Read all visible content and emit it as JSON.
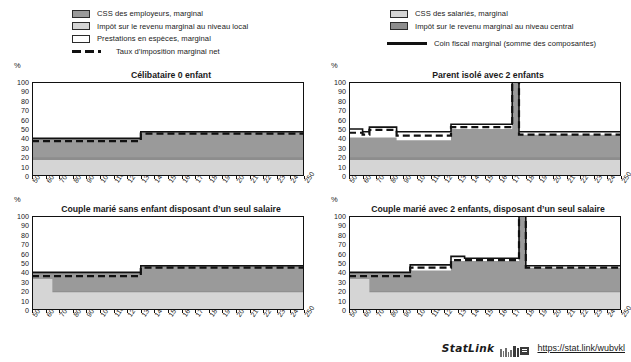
{
  "legend": {
    "left_items": [
      {
        "key": "css-employeurs",
        "swatch": "dark",
        "label": "CSS des employeurs, marginal"
      },
      {
        "key": "impot-local",
        "swatch": "light",
        "label": "Impôt sur le revenu marginal au niveau local"
      },
      {
        "key": "prestations",
        "swatch": "white",
        "label": "Prestations en espèces, marginal"
      },
      {
        "key": "taux-net",
        "swatch": "dashed",
        "label": "Taux d’imposition marginal net"
      }
    ],
    "right_items": [
      {
        "key": "css-salaries",
        "swatch": "light",
        "label": "CSS des salariés, marginal"
      },
      {
        "key": "impot-central",
        "swatch": "mid",
        "label": "Impôt sur le revenu marginal au niveau central"
      },
      {
        "key": "coin-fiscal",
        "swatch": "solid",
        "label": "Coin fiscal marginal (somme des composantes)"
      }
    ]
  },
  "axis": {
    "unit": "%",
    "y_ticks": [
      100,
      90,
      80,
      70,
      60,
      50,
      40,
      30,
      20,
      10,
      0
    ],
    "x_ticks": [
      50,
      60,
      70,
      80,
      90,
      100,
      110,
      120,
      130,
      140,
      150,
      160,
      170,
      180,
      190,
      200,
      210,
      220,
      230,
      240,
      250
    ]
  },
  "footer": {
    "statlink_word": "StatLink",
    "statlink_glyph": "barcode-icon",
    "url": "https://stat.link/wubvkl"
  },
  "colors": {
    "css_employeurs": "#9a9a9a",
    "impot_central": "#8d8d8d",
    "css_salaries": "#d5d5d5",
    "impot_local": "#d5d5d5",
    "prestations": "#ffffff",
    "line": "#111111"
  },
  "chart_data": [
    {
      "id": "celibataire-0-enfant",
      "type": "area",
      "title": "Célibataire 0 enfant",
      "xlabel": "",
      "ylabel": "%",
      "xlim": [
        50,
        250
      ],
      "ylim": [
        0,
        100
      ],
      "grid": false,
      "legend_position": "top",
      "x": [
        50,
        60,
        70,
        80,
        90,
        100,
        110,
        120,
        125,
        130,
        140,
        150,
        160,
        170,
        180,
        190,
        200,
        210,
        220,
        230,
        240,
        250
      ],
      "series": [
        {
          "name": "CSS des salariés, marginal",
          "stack": 1,
          "values": [
            5,
            5,
            5,
            5,
            5,
            5,
            5,
            5,
            5,
            5,
            5,
            5,
            5,
            5,
            5,
            5,
            5,
            5,
            5,
            5,
            5,
            5
          ]
        },
        {
          "name": "Impôt sur le revenu marginal au niveau local",
          "stack": 2,
          "values": [
            17,
            17,
            17,
            17,
            17,
            17,
            17,
            17,
            17,
            17,
            17,
            17,
            17,
            17,
            17,
            17,
            17,
            17,
            17,
            17,
            17,
            17
          ]
        },
        {
          "name": "Impôt sur le revenu marginal au niveau central",
          "stack": 3,
          "values": [
            20,
            20,
            20,
            20,
            20,
            20,
            20,
            20,
            20,
            20,
            20,
            20,
            20,
            20,
            20,
            20,
            20,
            20,
            20,
            20,
            20,
            20
          ]
        },
        {
          "name": "CSS des employeurs, marginal",
          "stack": 4,
          "values": [
            40,
            40,
            40,
            40,
            40,
            40,
            40,
            40,
            40,
            47,
            47,
            47,
            47,
            47,
            47,
            47,
            47,
            47,
            47,
            47,
            47,
            47
          ]
        }
      ],
      "lines": [
        {
          "name": "Coin fiscal marginal (somme des composantes)",
          "style": "solid",
          "values": [
            40,
            40,
            40,
            40,
            40,
            40,
            40,
            40,
            40,
            47,
            47,
            47,
            47,
            47,
            47,
            47,
            47,
            47,
            47,
            47,
            47,
            47
          ]
        },
        {
          "name": "Taux d’imposition marginal net",
          "style": "dashed",
          "values": [
            37,
            37,
            37,
            37,
            37,
            37,
            37,
            37,
            37,
            45,
            45,
            45,
            45,
            45,
            45,
            45,
            45,
            45,
            45,
            45,
            45,
            45
          ]
        }
      ]
    },
    {
      "id": "parent-isole-2-enfants",
      "type": "area",
      "title": "Parent isolé avec 2 enfants",
      "xlabel": "",
      "ylabel": "%",
      "xlim": [
        50,
        250
      ],
      "ylim": [
        0,
        100
      ],
      "grid": false,
      "legend_position": "top",
      "x": [
        50,
        60,
        65,
        70,
        80,
        85,
        90,
        100,
        110,
        120,
        125,
        130,
        140,
        150,
        160,
        168,
        170,
        172,
        175,
        180,
        190,
        200,
        210,
        220,
        230,
        240,
        250
      ],
      "series": [
        {
          "name": "CSS des salariés, marginal",
          "stack": 1,
          "values": [
            5,
            5,
            5,
            5,
            5,
            5,
            5,
            5,
            5,
            5,
            5,
            5,
            5,
            5,
            5,
            5,
            5,
            5,
            5,
            5,
            5,
            5,
            5,
            5,
            5,
            5,
            5
          ]
        },
        {
          "name": "Impôt sur le revenu marginal au niveau local",
          "stack": 2,
          "values": [
            17,
            17,
            17,
            17,
            17,
            17,
            17,
            17,
            17,
            17,
            17,
            17,
            17,
            17,
            17,
            17,
            17,
            17,
            17,
            17,
            17,
            17,
            17,
            17,
            17,
            17,
            17
          ]
        },
        {
          "name": "Impôt sur le revenu marginal au niveau central",
          "stack": 3,
          "values": [
            20,
            20,
            20,
            20,
            20,
            20,
            20,
            20,
            20,
            20,
            20,
            20,
            20,
            20,
            20,
            20,
            20,
            20,
            20,
            20,
            20,
            20,
            20,
            20,
            20,
            20,
            20
          ]
        },
        {
          "name": "CSS des employeurs, marginal",
          "stack": 4,
          "values": [
            41,
            41,
            41,
            41,
            41,
            38,
            38,
            38,
            38,
            38,
            50,
            50,
            50,
            50,
            50,
            50,
            100,
            100,
            44,
            44,
            44,
            44,
            44,
            44,
            44,
            44,
            44
          ]
        }
      ],
      "lines": [
        {
          "name": "Coin fiscal marginal (somme des composantes)",
          "style": "solid",
          "values": [
            50,
            47,
            52,
            52,
            52,
            47,
            47,
            47,
            47,
            47,
            55,
            55,
            55,
            55,
            55,
            55,
            100,
            100,
            47,
            47,
            47,
            47,
            47,
            47,
            47,
            47,
            47
          ]
        },
        {
          "name": "Taux d’imposition marginal net",
          "style": "dashed",
          "values": [
            46,
            44,
            49,
            49,
            49,
            43,
            43,
            43,
            43,
            43,
            52,
            52,
            52,
            52,
            52,
            52,
            100,
            100,
            44,
            44,
            44,
            44,
            44,
            44,
            44,
            44,
            44
          ]
        }
      ]
    },
    {
      "id": "couple-marie-sans-enfant",
      "type": "area",
      "title": "Couple marié sans enfant disposant d’un seul salaire",
      "xlabel": "",
      "ylabel": "%",
      "xlim": [
        50,
        250
      ],
      "ylim": [
        0,
        100
      ],
      "grid": false,
      "legend_position": "top",
      "x": [
        50,
        55,
        60,
        65,
        70,
        80,
        90,
        100,
        110,
        120,
        125,
        130,
        140,
        150,
        160,
        170,
        180,
        190,
        200,
        210,
        220,
        230,
        240,
        250
      ],
      "series": [
        {
          "name": "CSS des salariés, marginal",
          "stack": 1,
          "values": [
            5,
            5,
            5,
            5,
            5,
            5,
            5,
            5,
            5,
            5,
            5,
            5,
            5,
            5,
            5,
            5,
            5,
            5,
            5,
            5,
            5,
            5,
            5,
            5
          ]
        },
        {
          "name": "Impôt sur le revenu marginal au niveau local",
          "stack": 2,
          "values": [
            33,
            33,
            33,
            19,
            19,
            19,
            19,
            19,
            19,
            19,
            19,
            19,
            19,
            19,
            19,
            19,
            19,
            19,
            19,
            19,
            19,
            19,
            19,
            19
          ]
        },
        {
          "name": "Impôt sur le revenu marginal au niveau central",
          "stack": 3,
          "values": [
            33,
            33,
            33,
            20,
            20,
            20,
            20,
            20,
            20,
            20,
            20,
            20,
            20,
            20,
            20,
            20,
            20,
            20,
            20,
            20,
            20,
            20,
            20,
            20
          ]
        },
        {
          "name": "CSS des employeurs, marginal",
          "stack": 4,
          "values": [
            40,
            40,
            40,
            40,
            40,
            40,
            40,
            40,
            40,
            40,
            40,
            47,
            47,
            47,
            47,
            47,
            47,
            47,
            47,
            47,
            47,
            47,
            47,
            47
          ]
        }
      ],
      "lines": [
        {
          "name": "Coin fiscal marginal (somme des composantes)",
          "style": "solid",
          "values": [
            40,
            40,
            40,
            40,
            40,
            40,
            40,
            40,
            40,
            40,
            40,
            47,
            47,
            47,
            47,
            47,
            47,
            47,
            47,
            47,
            47,
            47,
            47,
            47
          ]
        },
        {
          "name": "Taux d’imposition marginal net",
          "style": "dashed",
          "values": [
            36,
            36,
            36,
            36,
            36,
            36,
            36,
            36,
            36,
            36,
            36,
            45,
            45,
            45,
            45,
            45,
            45,
            45,
            45,
            45,
            45,
            45,
            45,
            45
          ]
        }
      ]
    },
    {
      "id": "couple-marie-2-enfants",
      "type": "area",
      "title": "Couple marié avec 2 enfants, disposant d’un seul salaire",
      "xlabel": "",
      "ylabel": "%",
      "xlim": [
        50,
        250
      ],
      "ylim": [
        0,
        100
      ],
      "grid": false,
      "legend_position": "top",
      "x": [
        50,
        55,
        60,
        65,
        70,
        80,
        90,
        95,
        100,
        110,
        120,
        125,
        130,
        135,
        140,
        150,
        160,
        170,
        175,
        177,
        180,
        190,
        200,
        210,
        220,
        230,
        240,
        250
      ],
      "series": [
        {
          "name": "CSS des salariés, marginal",
          "stack": 1,
          "values": [
            5,
            5,
            5,
            5,
            5,
            5,
            5,
            5,
            5,
            5,
            5,
            5,
            5,
            5,
            5,
            5,
            5,
            5,
            5,
            5,
            5,
            5,
            5,
            5,
            5,
            5,
            5,
            5
          ]
        },
        {
          "name": "Impôt sur le revenu marginal au niveau local",
          "stack": 2,
          "values": [
            33,
            33,
            33,
            19,
            19,
            19,
            19,
            19,
            19,
            19,
            19,
            19,
            19,
            19,
            19,
            19,
            19,
            19,
            19,
            19,
            19,
            19,
            19,
            19,
            19,
            19,
            19,
            19
          ]
        },
        {
          "name": "Impôt sur le revenu marginal au niveau central",
          "stack": 3,
          "values": [
            33,
            33,
            33,
            20,
            20,
            20,
            20,
            20,
            20,
            20,
            20,
            20,
            20,
            20,
            20,
            20,
            20,
            20,
            20,
            20,
            20,
            20,
            20,
            20,
            20,
            20,
            20,
            20
          ]
        },
        {
          "name": "CSS des employeurs, marginal",
          "stack": 4,
          "values": [
            40,
            40,
            40,
            40,
            40,
            40,
            40,
            42,
            42,
            42,
            42,
            52,
            52,
            52,
            52,
            52,
            52,
            52,
            100,
            100,
            45,
            45,
            45,
            45,
            45,
            45,
            45,
            45
          ]
        }
      ],
      "lines": [
        {
          "name": "Coin fiscal marginal (somme des composantes)",
          "style": "solid",
          "values": [
            40,
            40,
            40,
            40,
            40,
            40,
            40,
            48,
            48,
            48,
            48,
            57,
            57,
            55,
            55,
            55,
            55,
            55,
            100,
            100,
            47,
            47,
            47,
            47,
            47,
            47,
            47,
            47
          ]
        },
        {
          "name": "Taux d’imposition marginal net",
          "style": "dashed",
          "values": [
            36,
            36,
            36,
            36,
            36,
            36,
            36,
            45,
            45,
            45,
            45,
            53,
            53,
            53,
            53,
            53,
            53,
            53,
            100,
            100,
            45,
            45,
            45,
            45,
            45,
            45,
            45,
            45
          ]
        }
      ]
    }
  ]
}
